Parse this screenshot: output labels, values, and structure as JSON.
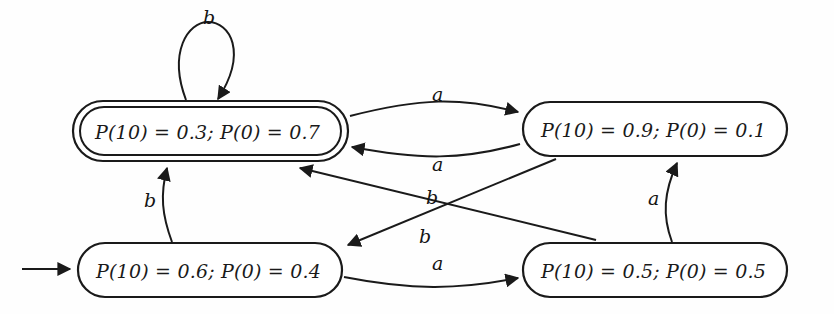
{
  "diagram": {
    "type": "state-machine",
    "alphabet": [
      "a",
      "b"
    ],
    "ink_color": "#1a1a1a",
    "background_color": "#fefefe",
    "states": [
      {
        "id": "q0",
        "label": "P(10) = 0.3; P(0) = 0.7",
        "accepting": true,
        "initial": false,
        "position": "top-left"
      },
      {
        "id": "q1",
        "label": "P(10) = 0.9; P(0) = 0.1",
        "accepting": false,
        "initial": false,
        "position": "top-right"
      },
      {
        "id": "q2",
        "label": "P(10) = 0.6; P(0) = 0.4",
        "accepting": false,
        "initial": true,
        "position": "bottom-left"
      },
      {
        "id": "q3",
        "label": "P(10) = 0.5; P(0) = 0.5",
        "accepting": false,
        "initial": false,
        "position": "bottom-right"
      }
    ],
    "transitions": [
      {
        "id": "t1",
        "from": "q0",
        "to": "q0",
        "label": "b",
        "shape": "self-loop-top"
      },
      {
        "id": "t2",
        "from": "q0",
        "to": "q1",
        "label": "a",
        "shape": "curve-top-right"
      },
      {
        "id": "t3",
        "from": "q1",
        "to": "q0",
        "label": "a",
        "shape": "curve-top-left"
      },
      {
        "id": "t4",
        "from": "q2",
        "to": "q0",
        "label": "b",
        "shape": "vertical-left"
      },
      {
        "id": "t5",
        "from": "q3",
        "to": "q0",
        "label": "b",
        "shape": "diagonal-up-left"
      },
      {
        "id": "t6",
        "from": "q1",
        "to": "q2",
        "label": "b",
        "shape": "diagonal-down-left"
      },
      {
        "id": "t7",
        "from": "q2",
        "to": "q3",
        "label": "a",
        "shape": "curve-bottom-right"
      },
      {
        "id": "t8",
        "from": "q3",
        "to": "q1",
        "label": "a",
        "shape": "vertical-right"
      }
    ],
    "labels": {
      "loop_b": "b",
      "top_a_right": "a",
      "top_a_left": "a",
      "left_b": "b",
      "cross_b_upper": "b",
      "cross_b_lower": "b",
      "bottom_a": "a",
      "right_a": "a"
    }
  }
}
